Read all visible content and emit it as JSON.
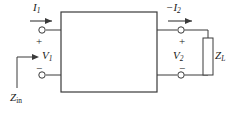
{
  "figure": {
    "type": "two-port-network-circuit-diagram",
    "background_color": "#ffffff",
    "line_color": "#3a3a3a",
    "text_color": "#1a1a1a"
  },
  "labels": {
    "input_current": "I",
    "input_current_sub": "1",
    "output_current_prefix": "−",
    "output_current": "I",
    "output_current_sub": "2",
    "input_voltage": "V",
    "input_voltage_sub": "1",
    "output_voltage": "V",
    "output_voltage_sub": "2",
    "load_impedance": "Z",
    "load_impedance_sub": "L",
    "input_impedance": "Z",
    "input_impedance_sub": "in"
  },
  "polarity": {
    "input_plus": "+",
    "input_minus": "−",
    "output_plus": "+",
    "output_minus": "−"
  },
  "geometry": {
    "network_box": {
      "x": 61,
      "y": 12,
      "width": 96,
      "height": 80
    },
    "resistor_box": {
      "x": 203,
      "y": 38,
      "width": 10,
      "height": 37
    },
    "terminals": [
      {
        "name": "input-top",
        "cx": 42,
        "cy": 30
      },
      {
        "name": "input-bottom",
        "cx": 42,
        "cy": 75
      },
      {
        "name": "output-top",
        "cx": 181,
        "cy": 30
      },
      {
        "name": "output-bottom",
        "cx": 181,
        "cy": 75
      }
    ]
  }
}
